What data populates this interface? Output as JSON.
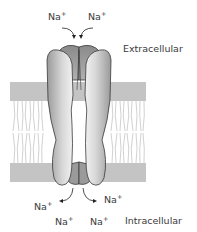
{
  "diagram": {
    "regions": {
      "top": "Extracellular",
      "bottom": "Intracellular"
    },
    "ions_extracellular": [
      {
        "symbol": "Na",
        "charge": "+"
      },
      {
        "symbol": "Na",
        "charge": "+"
      }
    ],
    "ions_intracellular": [
      {
        "symbol": "Na",
        "charge": "+"
      },
      {
        "symbol": "Na",
        "charge": "+"
      },
      {
        "symbol": "Na",
        "charge": "+"
      },
      {
        "symbol": "Na",
        "charge": "+"
      }
    ],
    "colors": {
      "membrane_band": "#c4c4c4",
      "lipid_tail": "#b8b8b8",
      "protein_outline": "#3a3a3a",
      "protein_light": "#eeeeee",
      "protein_dark": "#8e8e8e"
    }
  }
}
